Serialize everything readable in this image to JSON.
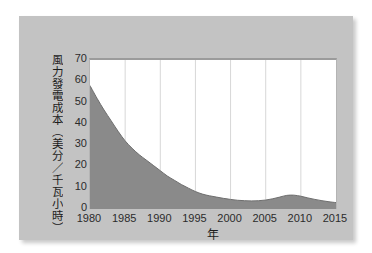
{
  "chart_data": {
    "type": "area",
    "title": "",
    "xlabel": "年",
    "ylabel": "風力發電成本（美分／千瓦小時）",
    "xlim": [
      1980,
      2015
    ],
    "ylim": [
      0,
      70
    ],
    "grid": "vertical",
    "legend": "none",
    "series_name": "風力發電成本",
    "fill_color": "#8a8a8a",
    "line_color": "#6e6e6e",
    "plot_background": "#ffffff",
    "panel_background": "#c3c3c3",
    "page_background": "#ffffff",
    "xticks": [
      "1980",
      "1985",
      "1990",
      "1995",
      "2000",
      "2005",
      "2010",
      "2015"
    ],
    "yticks": [
      "0",
      "10",
      "20",
      "30",
      "40",
      "50",
      "60",
      "70"
    ],
    "x": [
      1980,
      1981,
      1982,
      1983,
      1984,
      1985,
      1986,
      1987,
      1988,
      1989,
      1990,
      1991,
      1992,
      1993,
      1994,
      1995,
      1996,
      1997,
      1998,
      1999,
      2000,
      2001,
      2002,
      2003,
      2004,
      2005,
      2006,
      2007,
      2008,
      2009,
      2010,
      2011,
      2012,
      2013,
      2014,
      2015
    ],
    "values": [
      58.0,
      52.0,
      46.5,
      41.5,
      36.5,
      32.0,
      28.5,
      25.5,
      23.0,
      20.5,
      18.0,
      15.5,
      13.5,
      11.5,
      9.8,
      8.2,
      7.0,
      6.2,
      5.6,
      5.0,
      4.5,
      4.1,
      3.9,
      3.8,
      3.9,
      4.2,
      4.8,
      5.6,
      6.4,
      6.5,
      6.0,
      5.2,
      4.5,
      3.9,
      3.4,
      3.0
    ]
  },
  "axis": {
    "y_title": "風力發電成本（美分／千瓦小時）",
    "x_title": "年"
  }
}
